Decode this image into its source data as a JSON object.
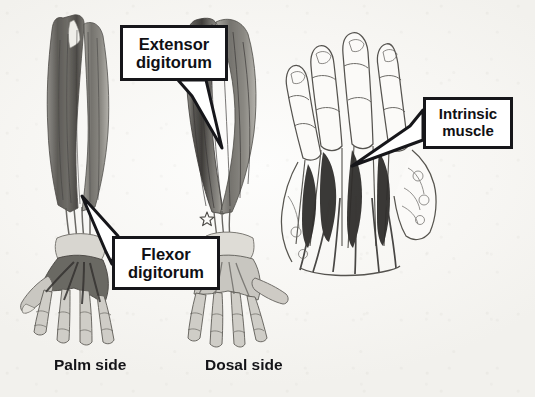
{
  "figure": {
    "background_color": "#f8f7f5",
    "ink_color": "#16161a"
  },
  "callouts": [
    {
      "id": "extensor",
      "name": "extensor-digitorum-callout",
      "line1": "Extensor",
      "line2": "digitorum",
      "points_to": "dorsal-forearm-extensor-muscle"
    },
    {
      "id": "flexor",
      "name": "flexor-digitorum-callout",
      "line1": "Flexor",
      "line2": "digitorum",
      "points_to": "palmar-forearm-flexor-muscle"
    },
    {
      "id": "intrinsic",
      "name": "intrinsic-muscle-callout",
      "line1": "Intrinsic",
      "line2": "muscle",
      "points_to": "interosseous-muscles-of-hand"
    }
  ],
  "captions": {
    "palm": "Palm side",
    "dorsal": "Dosal side"
  },
  "panels": [
    {
      "id": "palm-forearm",
      "label": "Palm side forearm and hand, flexor compartment"
    },
    {
      "id": "dorsal-forearm",
      "label": "Dorsal side forearm and hand, extensor compartment"
    },
    {
      "id": "hand-intrinsics",
      "label": "Dorsal hand showing intrinsic interosseous muscles"
    }
  ],
  "markers": [
    {
      "id": "star",
      "glyph": "☆",
      "name": "star-marker"
    }
  ],
  "background_ghost_text": [
    " ",
    " ",
    " ",
    " ",
    " ",
    " "
  ]
}
